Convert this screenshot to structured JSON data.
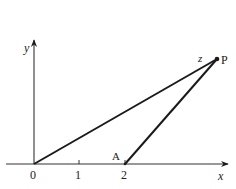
{
  "diagram": {
    "colors": {
      "line": "#1a1a1a",
      "axis": "#333333",
      "background": "#ffffff"
    },
    "axes": {
      "x_label": "x",
      "y_label": "y"
    },
    "ticks": [
      {
        "label": "0"
      },
      {
        "label": "1"
      },
      {
        "label": "2"
      }
    ],
    "points": {
      "A": {
        "label": "A"
      },
      "P": {
        "label": "P"
      }
    },
    "annotations": {
      "z_label": "z"
    }
  }
}
